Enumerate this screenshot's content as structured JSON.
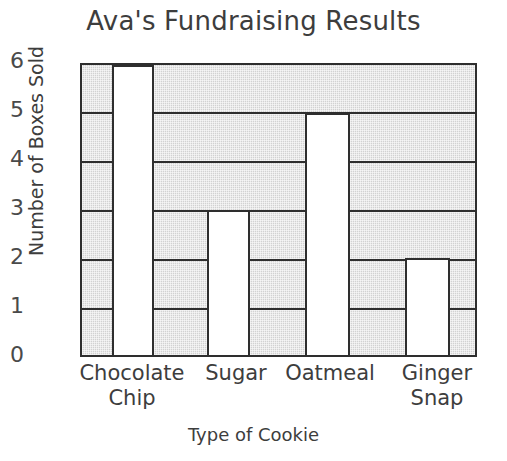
{
  "chart_data": {
    "type": "bar",
    "title": "Ava's Fundraising Results",
    "xlabel": "Type of Cookie",
    "ylabel": "Number of Boxes Sold",
    "categories": [
      "Chocolate Chip",
      "Sugar",
      "Oatmeal",
      "Ginger Snap"
    ],
    "values": [
      6,
      3,
      5,
      2
    ],
    "ylim": [
      0,
      6
    ],
    "yticks": [
      0,
      1,
      2,
      3,
      4,
      5,
      6
    ],
    "ytick_labels": [
      "0",
      "1",
      "2",
      "3",
      "4",
      "5",
      "6"
    ],
    "grid": true,
    "legend": false,
    "bar_color": "#ffffff",
    "plot_background_color": "#d2d2d2",
    "axis_color": "#2e2e2e",
    "text_color": "#3d3d3d",
    "category_lines": [
      [
        "Chocolate",
        "Chip"
      ],
      [
        "Sugar"
      ],
      [
        "Oatmeal"
      ],
      [
        "Ginger",
        "Snap"
      ]
    ]
  }
}
